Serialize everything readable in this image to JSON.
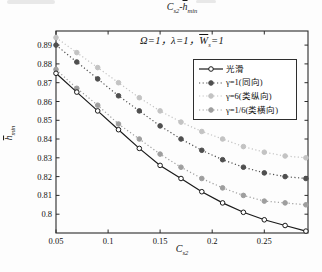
{
  "display": {
    "title": {
      "c": "C",
      "c_sub": "s2",
      "dash": "-",
      "h": "h",
      "h_sub": "min"
    },
    "subtitle": {
      "lead": "Ω=1，λ=1，",
      "w": "W",
      "w_sub": "s",
      "tail": "=1"
    },
    "ylabel": {
      "h": "h",
      "sub": "min"
    },
    "xlabel": {
      "c": "C",
      "sub": "s2"
    }
  },
  "chart_data": {
    "type": "line",
    "subtitle": "Ω=1，λ=1，W̄_s=1",
    "xlabel": "C_s2",
    "ylabel": "h̄_min",
    "xlim": [
      0.05,
      0.292
    ],
    "ylim": [
      0.79,
      0.8975
    ],
    "grid": false,
    "legend_position": "upper right inside",
    "frame_color": "#2b2b2b",
    "xticks": [
      {
        "v": 0.05,
        "label": "0.05"
      },
      {
        "v": 0.1,
        "label": "0.1"
      },
      {
        "v": 0.15,
        "label": "0.15"
      },
      {
        "v": 0.2,
        "label": "0.2"
      },
      {
        "v": 0.25,
        "label": "0.25"
      }
    ],
    "yticks": [
      {
        "v": 0.8,
        "label": "0.8"
      },
      {
        "v": 0.81,
        "label": "0.81"
      },
      {
        "v": 0.82,
        "label": "0.82"
      },
      {
        "v": 0.83,
        "label": "0.83"
      },
      {
        "v": 0.84,
        "label": "0.84"
      },
      {
        "v": 0.85,
        "label": "0.85"
      },
      {
        "v": 0.86,
        "label": "0.86"
      },
      {
        "v": 0.87,
        "label": "0.87"
      },
      {
        "v": 0.88,
        "label": "0.88"
      },
      {
        "v": 0.89,
        "label": "0.89"
      }
    ],
    "x": [
      0.05,
      0.07,
      0.09,
      0.11,
      0.13,
      0.15,
      0.17,
      0.19,
      0.21,
      0.23,
      0.25,
      0.27,
      0.29
    ],
    "series": [
      {
        "key": "smooth",
        "name": "光滑",
        "color": "#1a1a1a",
        "line": "solid",
        "marker": "open-circle",
        "draw_order": 4,
        "values": [
          0.875,
          0.865,
          0.855,
          0.845,
          0.835,
          0.826,
          0.819,
          0.812,
          0.806,
          0.801,
          0.797,
          0.794,
          0.791
        ]
      },
      {
        "key": "gamma-1",
        "name": "γ=1(同向)",
        "color": "#4f4f4f",
        "line": "dotted",
        "marker": "filled-circle",
        "draw_order": 3,
        "values": [
          0.89,
          0.881,
          0.872,
          0.863,
          0.855,
          0.847,
          0.84,
          0.834,
          0.829,
          0.825,
          0.822,
          0.82,
          0.819
        ]
      },
      {
        "key": "gamma-6",
        "name": "γ=6(类纵向)",
        "color": "#c3c3c3",
        "line": "dotted",
        "marker": "filled-circle",
        "draw_order": 1,
        "values": [
          0.894,
          0.886,
          0.878,
          0.87,
          0.862,
          0.855,
          0.849,
          0.844,
          0.84,
          0.836,
          0.833,
          0.831,
          0.83
        ]
      },
      {
        "key": "gamma-1-6",
        "name": "γ=1/6(类横向)",
        "color": "#9e9e9e",
        "line": "dotted",
        "marker": "filled-circle",
        "draw_order": 2,
        "values": [
          0.877,
          0.867,
          0.858,
          0.848,
          0.84,
          0.832,
          0.825,
          0.819,
          0.814,
          0.81,
          0.807,
          0.806,
          0.805
        ]
      }
    ]
  }
}
